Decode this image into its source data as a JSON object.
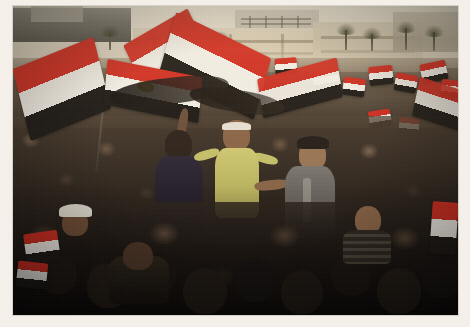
{
  "image": {
    "kind": "photograph",
    "subject": "Large crowd demonstration with Egyptian flags in a city square",
    "location_depicted": "Tahrir Square, Cairo, Egypt",
    "caption": "Dense crowd of protesters fills a public square, many waving Egyptian national flags, with government and museum buildings and palm trees on the hazy horizon.",
    "orientation": "landscape",
    "border": {
      "style": "photo-print-border",
      "color": "#f4f0e9",
      "top_px": 6,
      "left_px": 13,
      "right_px": 12,
      "bottom_px": 12
    },
    "plate": {
      "width_px": 445,
      "height_px": 309
    }
  },
  "palette": {
    "flag_red": "#d02b1f",
    "flag_white": "#f2efe8",
    "flag_black": "#1a1714",
    "flag_emblem_gold": "#c8a135",
    "sky_haze": "#efe9da",
    "building_stone": "#d4c7ad",
    "crowd_dark": "#1c1612",
    "crowd_mid": "#4a3c31",
    "shirt_yellow": "#c8c36a",
    "shirt_navy": "#241f2c",
    "jacket_grey": "#6d6a66",
    "border_cream": "#f4f0e9"
  },
  "scene": {
    "sky": {
      "name": "hazy-daylight-sky",
      "band_height_px": 62
    },
    "skyline": [
      {
        "name": "dark-building-left",
        "x": 0,
        "y": 2,
        "w": 118,
        "h": 34,
        "tone": "#6d6a63"
      },
      {
        "name": "tower-block-center",
        "x": 222,
        "y": 4,
        "w": 84,
        "h": 30,
        "tone": "#c3bbaa"
      },
      {
        "name": "egyptian-museum-facade",
        "x": 120,
        "y": 22,
        "w": 250,
        "h": 44,
        "tone": "#d4c7ad"
      },
      {
        "name": "stone-building-right",
        "x": 300,
        "y": 16,
        "w": 110,
        "h": 50,
        "tone": "#c4b79c"
      },
      {
        "name": "far-building-edge",
        "x": 380,
        "y": 6,
        "w": 70,
        "h": 40,
        "tone": "#9c937f"
      }
    ],
    "palms": [
      {
        "x": 96,
        "y": 26,
        "h": 18
      },
      {
        "x": 140,
        "y": 30,
        "h": 16
      },
      {
        "x": 172,
        "y": 28,
        "h": 18
      },
      {
        "x": 206,
        "y": 32,
        "h": 14
      },
      {
        "x": 332,
        "y": 24,
        "h": 20
      },
      {
        "x": 358,
        "y": 28,
        "h": 17
      },
      {
        "x": 392,
        "y": 22,
        "h": 22
      },
      {
        "x": 420,
        "y": 26,
        "h": 19
      }
    ],
    "crowd_bands": [
      {
        "name": "far-crowd",
        "y": 52,
        "h": 70,
        "density": "very-high",
        "tone": "#60523f"
      },
      {
        "name": "mid-crowd",
        "y": 110,
        "h": 110,
        "density": "very-high",
        "tone": "#3b3028"
      },
      {
        "name": "near-crowd",
        "y": 196,
        "h": 113,
        "density": "very-high",
        "tone": "#171210"
      }
    ]
  },
  "flags": {
    "description": "Egyptian national flag: horizontal red, white, black bands with the gold Eagle of Saladin centered on the white band.",
    "large": [
      {
        "name": "flag-large-left",
        "x": 6,
        "y": 46,
        "w": 86,
        "h": 74,
        "rot": -14,
        "skew": -8,
        "emblem": false
      },
      {
        "name": "flag-large-center",
        "x": 92,
        "y": 62,
        "w": 96,
        "h": 46,
        "rot": 5,
        "skew": 6,
        "emblem": true
      },
      {
        "name": "flag-large-upper-center",
        "x": 118,
        "y": 18,
        "w": 74,
        "h": 58,
        "rot": -26,
        "skew": -4,
        "emblem": false
      },
      {
        "name": "flag-large-right",
        "x": 150,
        "y": 28,
        "w": 104,
        "h": 64,
        "rot": 16,
        "skew": 10,
        "emblem": false
      },
      {
        "name": "flag-large-far-right",
        "x": 246,
        "y": 62,
        "w": 82,
        "h": 40,
        "rot": -9,
        "skew": -6,
        "emblem": false
      },
      {
        "name": "flag-edge-right",
        "x": 402,
        "y": 78,
        "w": 50,
        "h": 40,
        "rot": 12,
        "skew": 6,
        "emblem": false
      }
    ],
    "small": [
      {
        "name": "flag-small-01",
        "x": 12,
        "y": 226,
        "w": 34,
        "h": 30,
        "rot": -8
      },
      {
        "name": "flag-small-02",
        "x": 6,
        "y": 256,
        "w": 30,
        "h": 26,
        "rot": 6
      },
      {
        "name": "flag-small-03",
        "x": 300,
        "y": 64,
        "w": 26,
        "h": 20,
        "rot": -10
      },
      {
        "name": "flag-small-04",
        "x": 330,
        "y": 72,
        "w": 22,
        "h": 18,
        "rot": 8
      },
      {
        "name": "flag-small-05",
        "x": 356,
        "y": 60,
        "w": 24,
        "h": 19,
        "rot": -6
      },
      {
        "name": "flag-small-06",
        "x": 382,
        "y": 68,
        "w": 22,
        "h": 18,
        "rot": 10
      },
      {
        "name": "flag-small-07",
        "x": 408,
        "y": 56,
        "w": 26,
        "h": 20,
        "rot": -12
      },
      {
        "name": "flag-small-08",
        "x": 428,
        "y": 74,
        "w": 22,
        "h": 18,
        "rot": 7
      },
      {
        "name": "flag-small-09",
        "x": 262,
        "y": 52,
        "w": 22,
        "h": 17,
        "rot": -5
      },
      {
        "name": "flag-small-10",
        "x": 214,
        "y": 58,
        "w": 20,
        "h": 16,
        "rot": 9
      },
      {
        "name": "flag-small-11",
        "x": 418,
        "y": 196,
        "w": 26,
        "h": 50,
        "rot": 4
      },
      {
        "name": "flag-small-12",
        "x": 356,
        "y": 104,
        "w": 22,
        "h": 17,
        "rot": -9
      },
      {
        "name": "flag-small-13",
        "x": 386,
        "y": 112,
        "w": 20,
        "h": 16,
        "rot": 6
      }
    ]
  },
  "figures": [
    {
      "name": "man-navy-shirt-raised-arm",
      "x": 140,
      "y": 118,
      "w": 52,
      "h": 112,
      "clothing": "dark navy shirt",
      "note": "back to camera, arm raised"
    },
    {
      "name": "man-yellow-shirt-headband",
      "x": 196,
      "y": 112,
      "w": 56,
      "h": 108,
      "clothing": "olive-yellow t-shirt, white headband",
      "note": "central figure, arms out"
    },
    {
      "name": "man-grey-jacket-cap",
      "x": 268,
      "y": 130,
      "w": 58,
      "h": 102,
      "clothing": "grey jacket, dark cap",
      "note": "right of center, arm extended"
    },
    {
      "name": "man-white-cap-left",
      "x": 46,
      "y": 196,
      "w": 34,
      "h": 34,
      "clothing": "white cap",
      "note": "foreground left"
    },
    {
      "name": "man-black-jacket-foreground",
      "x": 96,
      "y": 236,
      "w": 60,
      "h": 60,
      "clothing": "dark jacket",
      "note": "foreground lower left"
    },
    {
      "name": "man-striped-shirt-right",
      "x": 330,
      "y": 200,
      "w": 48,
      "h": 56,
      "clothing": "dark striped shirt",
      "note": "foreground right"
    }
  ]
}
